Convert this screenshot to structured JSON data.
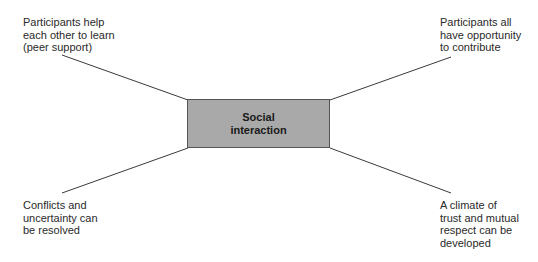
{
  "diagram": {
    "type": "spider",
    "center": {
      "label": "Social\ninteraction",
      "fill": "#a9a9a9"
    },
    "nodes": [
      {
        "position": "top-left",
        "label": "Participants help\neach other to learn\n(peer support)"
      },
      {
        "position": "top-right",
        "label": "Participants all\nhave opportunity\nto contribute"
      },
      {
        "position": "bottom-left",
        "label": "Conflicts and\nuncertainty can\nbe resolved"
      },
      {
        "position": "bottom-right",
        "label": "A climate of\ntrust and mutual\nrespect can be\ndeveloped"
      }
    ]
  }
}
